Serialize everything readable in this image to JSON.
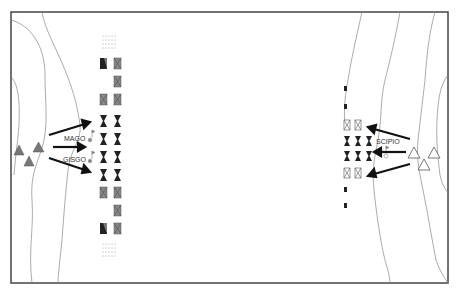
{
  "map": {
    "title": "Battle map diagram",
    "labels": {
      "carthaginian_commander_1": "MAGO",
      "carthaginian_commander_2": "GISGO",
      "roman_commander": "SCIPIO"
    },
    "colors": {
      "frame": "#444444",
      "river": "#888888",
      "carthaginian_fill": "#777777",
      "heavy_infantry": "#222222",
      "arrow": "#111111",
      "roman_outline": "#555555"
    },
    "carthaginian_camp_triangles": 3,
    "roman_camp_triangles": 3,
    "carthaginian_column_units": {
      "left_column": [
        "light-dots",
        "cavalry-elephant",
        "",
        "gray-x",
        "dark-heavy",
        "dark-heavy",
        "dark-heavy",
        "dark-heavy",
        "gray-x",
        "",
        "cavalry-elephant",
        "light-dots"
      ],
      "right_column": [
        "light-dots",
        "gray-x",
        "gray-x",
        "gray-x",
        "dark-heavy",
        "dark-heavy",
        "dark-heavy",
        "dark-heavy",
        "gray-x",
        "gray-x",
        "gray-x",
        "light-dots"
      ]
    },
    "roman_units": {
      "rows": [
        "cavalry-small",
        "cavalry-small",
        "outline-x outline-x",
        "dark dark dark",
        "dark dark dark",
        "outline-x outline-x",
        "cavalry-small",
        "cavalry-small"
      ]
    }
  },
  "caption": {
    "text": ""
  }
}
